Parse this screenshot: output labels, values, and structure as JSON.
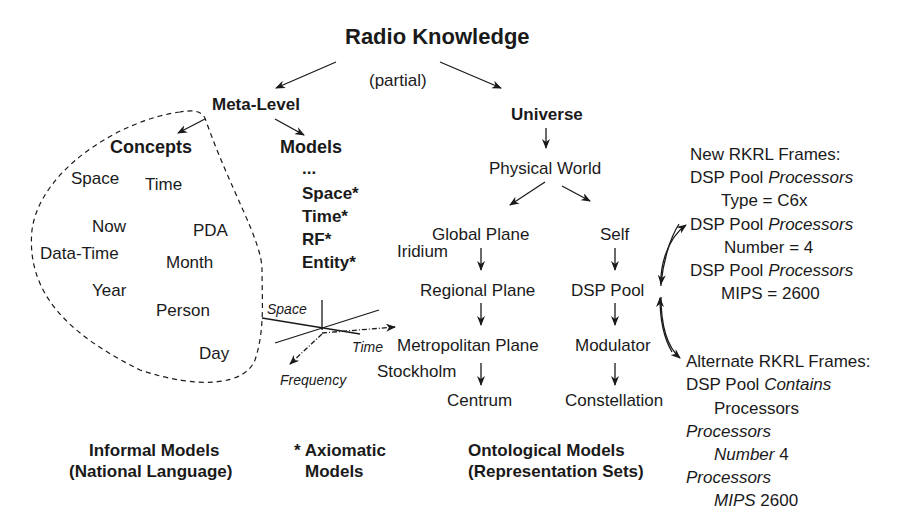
{
  "title": "Radio Knowledge",
  "subtitle": "(partial)",
  "meta_level": {
    "label": "Meta-Level",
    "concepts": {
      "label": "Concepts",
      "items": [
        "Space",
        "Time",
        "Now",
        "PDA",
        "Data-Time",
        "Month",
        "Year",
        "Person",
        "Day"
      ]
    },
    "models": {
      "label": "Models",
      "items": [
        "...",
        "Space*",
        "Time*",
        "RF*",
        "Entity*"
      ]
    }
  },
  "axes": {
    "space": "Space",
    "time": "Time",
    "frequency": "Frequency"
  },
  "universe": {
    "label": "Universe",
    "physical_world": "Physical World",
    "global_plane": "Global Plane",
    "iridium": "Iridium",
    "regional_plane": "Regional Plane",
    "metropolitan_plane": "Metropolitan Plane",
    "stockholm": "Stockholm",
    "centrum": "Centrum",
    "self": "Self",
    "dsp_pool": "DSP Pool",
    "modulator": "Modulator",
    "constellation": "Constellation"
  },
  "new_frames": {
    "header": "New RKRL Frames:",
    "rows": [
      {
        "subject": "DSP Pool ",
        "relation": "Processors",
        "value": "Type = C6x"
      },
      {
        "subject": "DSP Pool ",
        "relation": "Processors",
        "value": "Number = 4"
      },
      {
        "subject": "DSP Pool ",
        "relation": "Processors",
        "value": "MIPS = 2600"
      }
    ]
  },
  "alternate_frames": {
    "header": "Alternate RKRL Frames:",
    "line1_subject": "DSP Pool ",
    "line1_relation": "Contains",
    "line2": "Processors",
    "line3": "Processors",
    "line4_attr": "Number",
    "line4_val": " 4",
    "line5": "Processors",
    "line6_attr": "MIPS",
    "line6_val": " 2600"
  },
  "footer": {
    "informal_1": "Informal Models",
    "informal_2": "(National Language)",
    "axiomatic_1": "* Axiomatic",
    "axiomatic_2": "Models",
    "ontological_1": "Ontological Models",
    "ontological_2": "(Representation Sets)"
  }
}
